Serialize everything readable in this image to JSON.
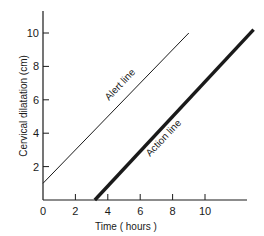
{
  "chart_data": {
    "type": "line",
    "title": "",
    "xlabel": "Time ( hours )",
    "ylabel": "Cervical dilatation (cm)",
    "xlim": [
      0,
      13
    ],
    "ylim": [
      0,
      11
    ],
    "xticks": [
      0,
      2,
      4,
      6,
      8,
      10
    ],
    "yticks": [
      2,
      4,
      6,
      8,
      10
    ],
    "grid": false,
    "legend": "none (lines labelled inline)",
    "series": [
      {
        "name": "Alert line",
        "style": "thin",
        "x": [
          0,
          9
        ],
        "y": [
          1,
          10
        ]
      },
      {
        "name": "Action line",
        "style": "thick",
        "x": [
          3.2,
          13
        ],
        "y": [
          0,
          10.2
        ]
      }
    ]
  },
  "labels": {
    "x_axis": "Time ( hours )",
    "y_axis": "Cervical dilatation (cm)",
    "alert_line": "Alert line",
    "action_line": "Action line",
    "x_ticks": [
      "0",
      "2",
      "4",
      "6",
      "8",
      "10"
    ],
    "y_ticks": [
      "2",
      "4",
      "6",
      "8",
      "10"
    ]
  },
  "colors": {
    "ink": "#1a1a1a",
    "background": "#ffffff"
  }
}
